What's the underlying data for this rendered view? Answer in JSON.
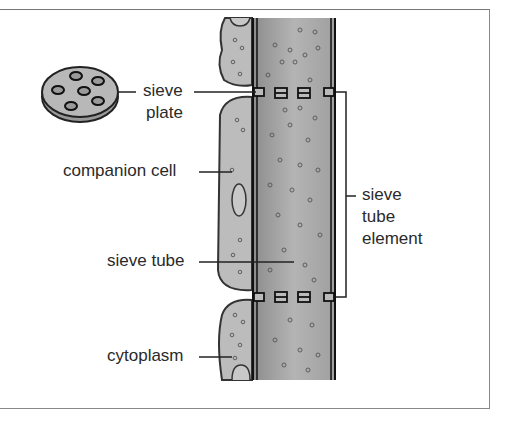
{
  "diagram": {
    "labels": {
      "sieve_plate_line1": "sieve",
      "sieve_plate_line2": "plate",
      "companion_cell": "companion cell",
      "sieve_tube": "sieve tube",
      "cytoplasm": "cytoplasm",
      "sieve_tube_element_line1": "sieve",
      "sieve_tube_element_line2": "tube",
      "sieve_tube_element_line3": "element"
    },
    "colors": {
      "tube_fill": "#a8a8a8",
      "cell_fill": "#bdbdbd",
      "outline": "#222222",
      "text": "#2a2a2a"
    }
  }
}
